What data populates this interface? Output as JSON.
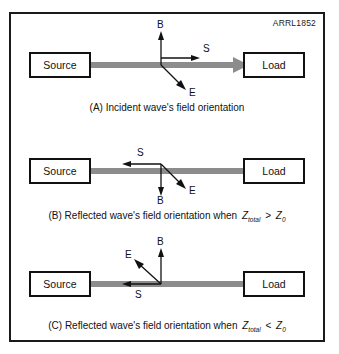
{
  "figure": {
    "id_label": "ARRL1852",
    "line_color": "#8c8c8c",
    "border_color": "#1a1a1a",
    "text_color": "#111111",
    "background": "#ffffff"
  },
  "labels": {
    "source": "Source",
    "load": "Load",
    "vector_b": "B",
    "vector_e": "E",
    "vector_s": "S"
  },
  "panels": [
    {
      "key": "a",
      "caption_prefix": "(A) Incident wave's field orientation",
      "caption_has_formula": false,
      "wave_direction": "right",
      "source_label": "Source",
      "load_label": "Load",
      "vectors": [
        {
          "name": "B",
          "direction": "up"
        },
        {
          "name": "S",
          "direction": "right"
        },
        {
          "name": "E",
          "direction": "down-right"
        }
      ]
    },
    {
      "key": "b",
      "caption_prefix": "(B) Reflected wave's field orientation when",
      "caption_has_formula": true,
      "formula": {
        "z_symbol": "Z",
        "z_subscript": "total",
        "comparator": ">",
        "z0_symbol": "Z",
        "z0_subscript": "0"
      },
      "wave_direction": "left",
      "source_label": "Source",
      "load_label": "Load",
      "vectors": [
        {
          "name": "S",
          "direction": "left"
        },
        {
          "name": "B",
          "direction": "down"
        },
        {
          "name": "E",
          "direction": "down-right"
        }
      ]
    },
    {
      "key": "c",
      "caption_prefix": "(C) Reflected wave's field orientation when",
      "caption_has_formula": true,
      "formula": {
        "z_symbol": "Z",
        "z_subscript": "total",
        "comparator": "<",
        "z0_symbol": "Z",
        "z0_subscript": "0"
      },
      "wave_direction": "left",
      "source_label": "Source",
      "load_label": "Load",
      "vectors": [
        {
          "name": "B",
          "direction": "up"
        },
        {
          "name": "E",
          "direction": "up-left"
        },
        {
          "name": "S",
          "direction": "left"
        }
      ]
    }
  ]
}
